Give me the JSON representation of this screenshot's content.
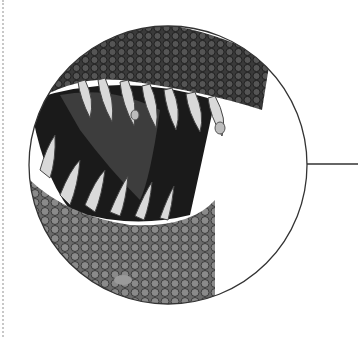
{
  "illustration": {
    "subject": "dinosaur-jaws-closeup",
    "style": "grayscale",
    "callout": {
      "cx": 168,
      "cy": 165,
      "r": 140,
      "stroke": "#333333"
    },
    "leader_line": {
      "x1": 307,
      "y1": 164,
      "x2": 358,
      "y2": 164
    }
  },
  "colors": {
    "background": "#ffffff",
    "scale_dark": "#2a2a2a",
    "scale_mid": "#6b6b6b",
    "scale_light": "#a8a8a8",
    "mouth_dark": "#0d0d0d",
    "tooth": "#d9d9d9"
  }
}
